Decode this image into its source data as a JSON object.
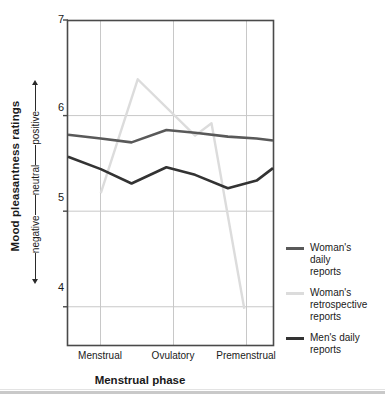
{
  "chart_data": {
    "type": "line",
    "title": "",
    "xlabel": "Menstrual phase",
    "ylabel": "Mood pleasantness ratings",
    "ylabel_scale": [
      "positive",
      "neutral",
      "negative"
    ],
    "categories": [
      "Menstrual",
      "Ovulatory",
      "Premenstrual"
    ],
    "x_tick_positions": [
      100,
      173,
      246
    ],
    "yticks": [
      7,
      6,
      5,
      4
    ],
    "ylim": [
      3.6,
      7.0
    ],
    "xlim": [
      0,
      1
    ],
    "grid": true,
    "legend_position": "right",
    "series": [
      {
        "name": "Woman's daily reports",
        "color": "#595959",
        "width": 2.6,
        "x": [
          0.0,
          0.16,
          0.31,
          0.48,
          0.62,
          0.78,
          0.92,
          1.0
        ],
        "values": [
          5.8,
          5.76,
          5.72,
          5.85,
          5.82,
          5.78,
          5.76,
          5.74
        ]
      },
      {
        "name": "Woman's retrospective reports",
        "color": "#dcdcdc",
        "width": 2.4,
        "x": [
          0.16,
          0.34,
          0.62,
          0.7,
          0.86
        ],
        "values": [
          5.19,
          6.38,
          5.79,
          5.92,
          3.98
        ]
      },
      {
        "name": "Men's daily reports",
        "color": "#333333",
        "width": 2.6,
        "x": [
          0.0,
          0.16,
          0.31,
          0.48,
          0.62,
          0.78,
          0.92,
          1.0
        ],
        "values": [
          5.57,
          5.44,
          5.29,
          5.46,
          5.38,
          5.24,
          5.32,
          5.45
        ]
      }
    ]
  },
  "legend": {
    "items": [
      {
        "label": "Woman's\ndaily\nreports",
        "lines": [
          "Woman's",
          "daily",
          "reports"
        ],
        "color": "#595959"
      },
      {
        "label": "Woman's\nretrospective\nreports",
        "lines": [
          "Woman's",
          "retrospective",
          "reports"
        ],
        "color": "#dcdcdc"
      },
      {
        "label": "Men's daily\nreports",
        "lines": [
          "Men's daily",
          "reports"
        ],
        "color": "#333333"
      }
    ]
  },
  "axes": {
    "y_axis_title": "Mood pleasantness ratings",
    "y_scale_positive": "positive",
    "y_scale_neutral": "neutral",
    "y_scale_negative": "negative",
    "x_axis_title": "Menstrual phase",
    "ytick_7": "7",
    "ytick_6": "6",
    "ytick_5": "5",
    "ytick_4": "4",
    "xtick_1": "Menstrual",
    "xtick_2": "Ovulatory",
    "xtick_3": "Premenstrual"
  },
  "colors": {
    "frame": "#4a4a4a",
    "grid": "#c8c8c8",
    "womans_daily": "#595959",
    "womans_retrospective": "#dcdcdc",
    "mens_daily": "#333333",
    "text": "#1a1a1a"
  }
}
